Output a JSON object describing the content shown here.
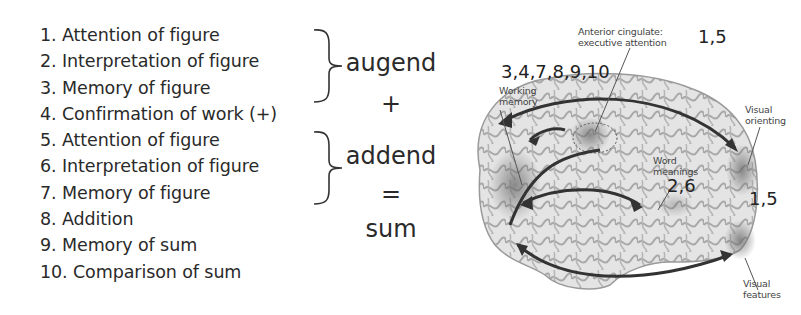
{
  "steps": [
    "1. Attention of figure",
    "2. Interpretation of figure",
    "3. Memory of figure",
    "4. Confirmation of work (+)",
    "5. Attention of figure",
    "6. Interpretation of figure",
    "7. Memory of figure",
    "8. Addition",
    "9. Memory of sum",
    "10. Comparison of sum"
  ],
  "equation": {
    "augend": "augend",
    "plus": "+",
    "addend": "addend",
    "equals": "=",
    "sum": "sum"
  },
  "brain": {
    "labels": {
      "anterior_cingulate": [
        "Anterior cingulate:",
        "executive attention"
      ],
      "working_memory": [
        "Working",
        "memory"
      ],
      "visual_orienting": [
        "Visual",
        "orienting"
      ],
      "word_meanings": [
        "Word",
        "meanings"
      ],
      "visual_features": [
        "Visual",
        "features"
      ]
    },
    "step_numbers": {
      "anterior_cingulate": "1,5",
      "working_memory": "3,4,7,8,9,10",
      "word_meanings": "2,6",
      "visual": "1,5"
    }
  }
}
